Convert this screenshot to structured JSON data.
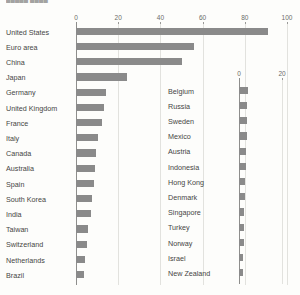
{
  "title_fragment": "█████ ████",
  "colors": {
    "bar": "#8a8a8a",
    "grid": "#e2e2de",
    "axis": "#8e8e8c",
    "background": "#fdfdfb",
    "label": "#464644"
  },
  "chart_data": [
    {
      "type": "bar",
      "orientation": "horizontal",
      "panel": "left",
      "title": "",
      "xlabel": "",
      "ylabel": "",
      "xlim": [
        0,
        100
      ],
      "ticks": [
        0,
        20,
        40,
        60,
        80,
        100
      ],
      "grid": true,
      "legend": "none",
      "categories": [
        "United States",
        "Euro area",
        "China",
        "Japan",
        "Germany",
        "United Kingdom",
        "France",
        "Italy",
        "Canada",
        "Australia",
        "Spain",
        "South Korea",
        "India",
        "Taiwan",
        "Switzerland",
        "Netherlands",
        "Brazil"
      ],
      "values": [
        91,
        56,
        50,
        24,
        14,
        13.5,
        12.5,
        10.5,
        9.5,
        9,
        8.5,
        7.5,
        7,
        5.5,
        5,
        4.5,
        4
      ]
    },
    {
      "type": "bar",
      "orientation": "horizontal",
      "panel": "right",
      "title": "",
      "xlabel": "",
      "ylabel": "",
      "xlim": [
        0,
        20
      ],
      "ticks": [
        0,
        20
      ],
      "grid": true,
      "legend": "none",
      "categories": [
        "Belgium",
        "Russia",
        "Sweden",
        "Mexico",
        "Austria",
        "Indonesia",
        "Hong Kong",
        "Denmark",
        "Singapore",
        "Turkey",
        "Norway",
        "Israel",
        "New Zealand"
      ],
      "values": [
        4.2,
        3.9,
        3.7,
        3.5,
        3.3,
        3.1,
        2.9,
        2.7,
        2.5,
        2.3,
        2.1,
        1.9,
        1.7
      ]
    }
  ]
}
